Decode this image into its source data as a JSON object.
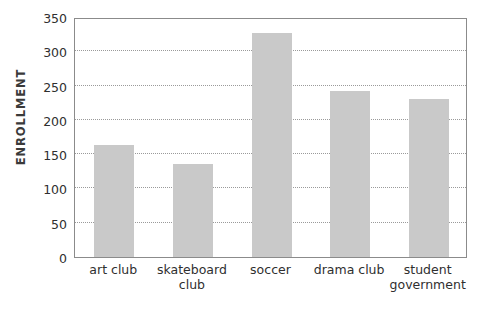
{
  "chart_data": {
    "type": "bar",
    "title": "",
    "subtitle": "",
    "xlabel": "",
    "ylabel": "ENROLLMENT",
    "categories": [
      "art club",
      "skateboard club",
      "soccer",
      "drama club",
      "student government"
    ],
    "values": [
      163,
      135,
      327,
      242,
      231
    ],
    "ylim": [
      0,
      350
    ],
    "ytick_labels": [
      "0",
      "50",
      "100",
      "150",
      "200",
      "250",
      "300",
      "350"
    ],
    "ytick_values": [
      0,
      50,
      100,
      150,
      200,
      250,
      300,
      350
    ],
    "grid": true,
    "grid_style": "dotted-horizontal",
    "legend": false,
    "legend_position": "none",
    "bar_color": "#c9c9c9",
    "axis_color": "#8b8b8b",
    "grid_color": "#9a9a9a",
    "text_color": "#2f2f2f"
  },
  "axis": {
    "y_title": "ENROLLMENT"
  },
  "x_label_lines": [
    [
      "art club"
    ],
    [
      "skateboard",
      "club"
    ],
    [
      "soccer"
    ],
    [
      "drama club"
    ],
    [
      "student",
      "government"
    ]
  ]
}
